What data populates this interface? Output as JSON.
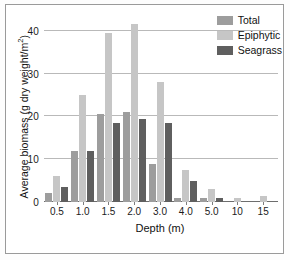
{
  "chart_data": {
    "type": "bar",
    "title": "",
    "xlabel": "Depth (m)",
    "ylabel": "Average biomass (g dry weight/m",
    "ylabel_sup": "2",
    "ylabel_suffix": ")",
    "categories": [
      "0.5",
      "1.0",
      "1.5",
      "2.0",
      "3.0",
      "4.0",
      "5.0",
      "10",
      "15"
    ],
    "series": [
      {
        "name": "Total",
        "color": "#9d9d9d",
        "values": [
          2,
          12,
          20.5,
          21,
          9,
          1,
          1,
          0,
          0
        ]
      },
      {
        "name": "Epiphytic",
        "color": "#c6c6c6",
        "values": [
          6,
          25,
          39.5,
          41.5,
          28,
          7.5,
          3,
          1,
          1.5
        ]
      },
      {
        "name": "Seagrass",
        "color": "#5f5f5f",
        "values": [
          3.5,
          12,
          18.5,
          19.5,
          18.5,
          5,
          1,
          0,
          0
        ]
      }
    ],
    "yticks": [
      "0",
      "10",
      "20",
      "30",
      "40"
    ],
    "ytick_values": [
      0,
      10,
      20,
      30,
      40
    ],
    "ylim": [
      0,
      43
    ],
    "grid": true,
    "legend_position": "top-right"
  }
}
